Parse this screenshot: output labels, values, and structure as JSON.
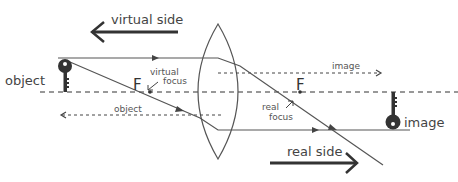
{
  "diagram": {
    "labels": {
      "virtual_side": "virtual side",
      "real_side": "real side",
      "object": "object",
      "image": "image",
      "virtual_focus_line1": "virtual",
      "virtual_focus_line2": "focus",
      "real_focus_line1": "real",
      "real_focus_line2": "focus",
      "focus_left": "F",
      "focus_right": "F",
      "image_distance": "image",
      "object_distance": "object"
    },
    "colors": {
      "line": "#555555",
      "ray": "#555555",
      "arrow": "#222222",
      "key": "#333333",
      "text": "#444444"
    },
    "elements": {
      "lens": "biconvex-lens",
      "optical_axis": "dashed-horizontal-axis",
      "object_icon": "key-icon",
      "image_icon": "inverted-key-icon"
    }
  }
}
